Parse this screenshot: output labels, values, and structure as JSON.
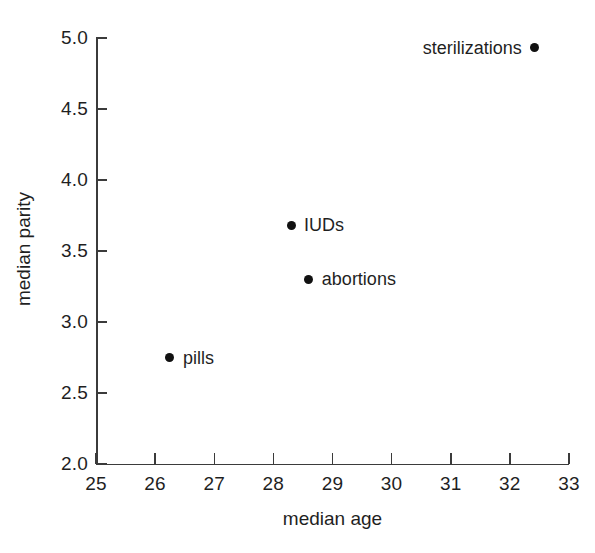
{
  "chart_data": {
    "type": "scatter",
    "title": "",
    "xlabel": "median age",
    "ylabel": "median parity",
    "xlim": [
      25,
      33
    ],
    "ylim": [
      2.0,
      5.0
    ],
    "grid": false,
    "legend": "none (points labeled inline)",
    "xticks": [
      "25",
      "26",
      "27",
      "28",
      "29",
      "30",
      "31",
      "32",
      "33"
    ],
    "xtick_values": [
      25,
      26,
      27,
      28,
      29,
      30,
      31,
      32,
      33
    ],
    "yticks": [
      "2.0",
      "2.5",
      "3.0",
      "3.5",
      "4.0",
      "4.5",
      "5.0"
    ],
    "ytick_values": [
      2.0,
      2.5,
      3.0,
      3.5,
      4.0,
      4.5,
      5.0
    ],
    "marker": "filled-circle",
    "marker_color": "#111111",
    "axis_color": "#3b3b3b",
    "background_color": "#ffffff",
    "points": [
      {
        "label": "pills",
        "x": 26.25,
        "y": 2.75,
        "label_side": "right"
      },
      {
        "label": "IUDs",
        "x": 28.3,
        "y": 3.68,
        "label_side": "right"
      },
      {
        "label": "abortions",
        "x": 28.6,
        "y": 3.3,
        "label_side": "right"
      },
      {
        "label": "sterilizations",
        "x": 32.42,
        "y": 4.93,
        "label_side": "left"
      }
    ]
  }
}
